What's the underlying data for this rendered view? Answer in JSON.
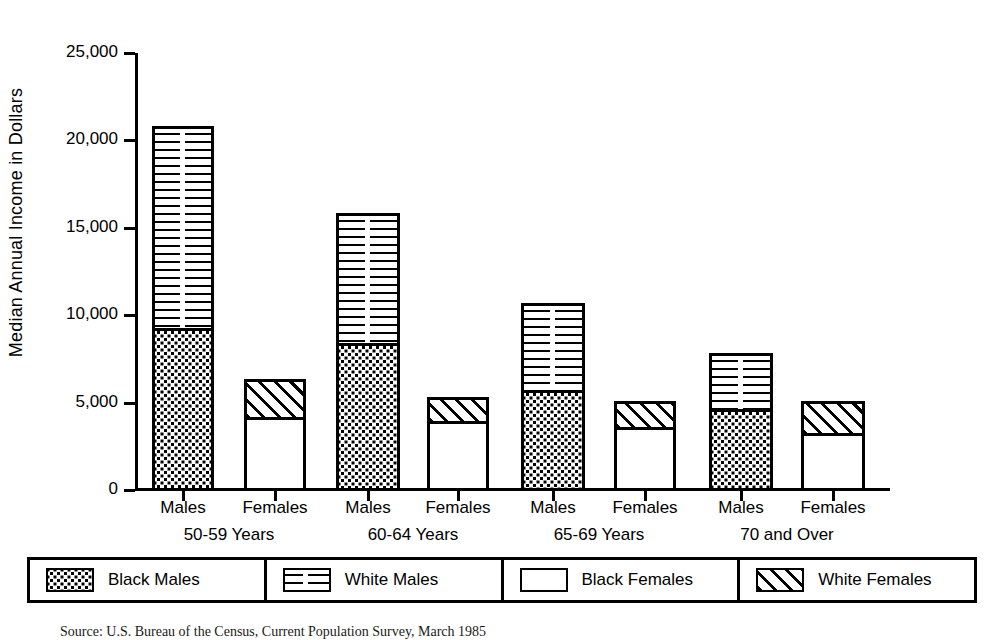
{
  "chart_data": {
    "type": "bar",
    "title": "",
    "xlabel": "",
    "ylabel": "Median Annual Income in Dollars",
    "ylim": [
      0,
      25000
    ],
    "ytick_labels": [
      "25,000",
      "20,000",
      "15,000",
      "10,000",
      "5,000",
      "0"
    ],
    "ytick_values": [
      25000,
      20000,
      15000,
      10000,
      5000,
      0
    ],
    "grid": false,
    "legend_position": "bottom",
    "stacked": true,
    "groups": [
      "50-59 Years",
      "60-64 Years",
      "65-69 Years",
      "70 and Over"
    ],
    "categories": [
      "Males 50-59 Years",
      "Females 50-59 Years",
      "Males 60-64 Years",
      "Females 60-64 Years",
      "Males 65-69 Years",
      "Females 65-69 Years",
      "Males 70 and Over",
      "Females 70 and Over"
    ],
    "sex_labels": [
      "Males",
      "Females",
      "Males",
      "Females",
      "Males",
      "Females",
      "Males",
      "Females"
    ],
    "series": [
      {
        "name": "Black Males",
        "pattern": "dots",
        "values": [
          9400,
          null,
          8500,
          null,
          5850,
          null,
          4750,
          null
        ]
      },
      {
        "name": "White Males",
        "pattern": "hlines",
        "values": [
          20800,
          null,
          15850,
          null,
          10700,
          null,
          7850,
          null
        ]
      },
      {
        "name": "Black Females",
        "pattern": "plain",
        "values": [
          null,
          4300,
          null,
          4050,
          null,
          3700,
          null,
          3400
        ]
      },
      {
        "name": "White Females",
        "pattern": "hatch",
        "values": [
          null,
          6350,
          null,
          5300,
          null,
          5100,
          null,
          5100
        ]
      }
    ],
    "bars": [
      {
        "label": "Males",
        "group": "50-59 Years",
        "total": 20800,
        "lower": 9400,
        "lower_series": "Black Males",
        "upper_series": "White Males"
      },
      {
        "label": "Females",
        "group": "50-59 Years",
        "total": 6350,
        "lower": 4300,
        "lower_series": "Black Females",
        "upper_series": "White Females"
      },
      {
        "label": "Males",
        "group": "60-64 Years",
        "total": 15850,
        "lower": 8500,
        "lower_series": "Black Males",
        "upper_series": "White Males"
      },
      {
        "label": "Females",
        "group": "60-64 Years",
        "total": 5300,
        "lower": 4050,
        "lower_series": "Black Females",
        "upper_series": "White Females"
      },
      {
        "label": "Males",
        "group": "65-69 Years",
        "total": 10700,
        "lower": 5850,
        "lower_series": "Black Males",
        "upper_series": "White Males"
      },
      {
        "label": "Females",
        "group": "65-69 Years",
        "total": 5100,
        "lower": 3700,
        "lower_series": "Black Females",
        "upper_series": "White Females"
      },
      {
        "label": "Males",
        "group": "70 and Over",
        "total": 7850,
        "lower": 4750,
        "lower_series": "Black Males",
        "upper_series": "White Males"
      },
      {
        "label": "Females",
        "group": "70 and Over",
        "total": 5100,
        "lower": 3400,
        "lower_series": "Black Females",
        "upper_series": "White Females"
      }
    ]
  },
  "legend": {
    "items": [
      {
        "label": "Black Males",
        "pattern": "dots"
      },
      {
        "label": "White Males",
        "pattern": "hlines"
      },
      {
        "label": "Black Females",
        "pattern": "plain"
      },
      {
        "label": "White Females",
        "pattern": "hatch"
      }
    ]
  },
  "caption": {
    "text": "Source:  U.S. Bureau of the Census, Current Population Survey, March 1985"
  },
  "colors": {
    "ink": "#000000",
    "paper": "#ffffff"
  }
}
